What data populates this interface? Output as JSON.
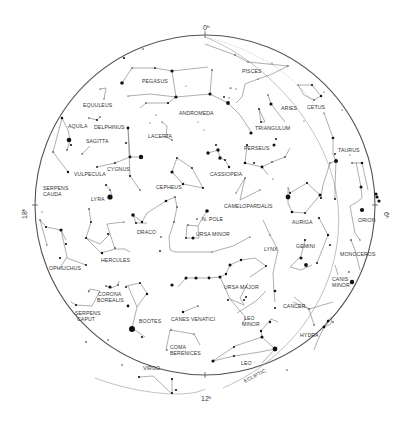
{
  "chart": {
    "type": "planisphere",
    "center": [
      205,
      205
    ],
    "radius": 170,
    "hour_markers": [
      {
        "label": "0h",
        "display": "0ʰ",
        "x": 205,
        "y": 29,
        "angle": 0
      },
      {
        "label": "6h",
        "display": "6ʰ",
        "x": 386,
        "y": 214,
        "angle": 90
      },
      {
        "label": "12h",
        "display": "12ʰ",
        "x": 206,
        "y": 399,
        "angle": 0
      },
      {
        "label": "18h",
        "display": "18ʰ",
        "x": 25,
        "y": 214,
        "angle": -90
      }
    ],
    "constellations": [
      {
        "name": "PEGASUS",
        "x": 142,
        "y": 83
      },
      {
        "name": "PISCES",
        "x": 253,
        "y": 73
      },
      {
        "name": "EQUULEUS",
        "x": 82,
        "y": 105
      },
      {
        "name": "ANDROMEDA",
        "x": 193,
        "y": 113
      },
      {
        "name": "ARIES",
        "x": 283,
        "y": 109
      },
      {
        "name": "CETUS",
        "x": 315,
        "y": 107
      },
      {
        "name": "AQUILA",
        "x": 67,
        "y": 128
      },
      {
        "name": "DELPHINUS",
        "x": 94,
        "y": 128
      },
      {
        "name": "TRIANGULUM",
        "x": 254,
        "y": 129
      },
      {
        "name": "SAGITTA",
        "x": 86,
        "y": 141
      },
      {
        "name": "LACERTA",
        "x": 148,
        "y": 136
      },
      {
        "name": "TAURUS",
        "x": 339,
        "y": 150
      },
      {
        "name": "PERSEUS",
        "x": 241,
        "y": 148
      },
      {
        "name": "CYGNUS",
        "x": 107,
        "y": 169
      },
      {
        "name": "VULPECULA",
        "x": 74,
        "y": 174
      },
      {
        "name": "CASSIOPEIA",
        "x": 210,
        "y": 174
      },
      {
        "name": "CEPHEUS",
        "x": 156,
        "y": 187
      },
      {
        "name": "SERPENS",
        "x": 43,
        "y": 188
      },
      {
        "name": "CAUDA",
        "x": 43,
        "y": 195
      },
      {
        "name": "LYRA",
        "x": 92,
        "y": 201
      },
      {
        "name": "CAMELOPARDALIS",
        "x": 224,
        "y": 206
      },
      {
        "name": "AURIGA",
        "x": 293,
        "y": 222
      },
      {
        "name": "ORION",
        "x": 359,
        "y": 221
      },
      {
        "name": "DRACO",
        "x": 137,
        "y": 232
      },
      {
        "name": "N. POLE",
        "x": 203,
        "y": 219
      },
      {
        "name": "URSA MINOR",
        "x": 196,
        "y": 235
      },
      {
        "name": "GEMINI",
        "x": 270,
        "y": 246
      },
      {
        "name": "LYNX",
        "x": 264,
        "y": 249
      },
      {
        "name": "MONOCEROS",
        "x": 341,
        "y": 254
      },
      {
        "name": "HERCULES",
        "x": 110,
        "y": 260
      },
      {
        "name": "OPHIUCHUS",
        "x": 55,
        "y": 268
      },
      {
        "name": "CANIS",
        "x": 333,
        "y": 280
      },
      {
        "name": "MINOR",
        "x": 333,
        "y": 286
      },
      {
        "name": "URSA MAJOR",
        "x": 236,
        "y": 288
      },
      {
        "name": "CORONA",
        "x": 108,
        "y": 295
      },
      {
        "name": "BOREALIS",
        "x": 108,
        "y": 301
      },
      {
        "name": "LEO",
        "x": 246,
        "y": 320
      },
      {
        "name": "MINOR",
        "x": 246,
        "y": 326
      },
      {
        "name": "CANCER",
        "x": 290,
        "y": 306
      },
      {
        "name": "SERPENS",
        "x": 84,
        "y": 315
      },
      {
        "name": "CAPUT",
        "x": 84,
        "y": 321
      },
      {
        "name": "CANES VENATICI",
        "x": 190,
        "y": 320
      },
      {
        "name": "BOOTES",
        "x": 148,
        "y": 322
      },
      {
        "name": "HYDRA",
        "x": 307,
        "y": 336
      },
      {
        "name": "COMA",
        "x": 177,
        "y": 348
      },
      {
        "name": "BERENICES",
        "x": 182,
        "y": 355
      },
      {
        "name": "VIRGO",
        "x": 149,
        "y": 369
      },
      {
        "name": "LEO",
        "x": 245,
        "y": 364
      },
      {
        "name": "ECLIPTIC",
        "x": 248,
        "y": 378
      }
    ],
    "annotations": {
      "ecliptic_label": "ECLIPTIC",
      "pole_label": "N. POLE"
    },
    "colors": {
      "background": "#ffffff",
      "stars": "#111111",
      "lines": "#777777",
      "text": "#333333",
      "rim": "#555555"
    }
  }
}
